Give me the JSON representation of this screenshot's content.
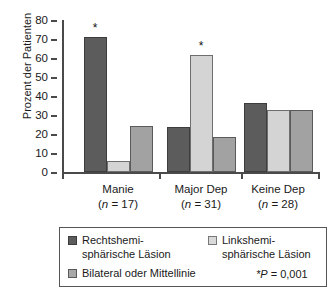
{
  "chart_data": {
    "type": "bar",
    "title": "",
    "xlabel": "",
    "ylabel": "Prozent der Patienten",
    "ylim": [
      0,
      80
    ],
    "yticks": [
      0,
      10,
      20,
      30,
      40,
      50,
      60,
      70,
      80
    ],
    "grid": false,
    "legend_position": "bottom",
    "categories": [
      "Manie",
      "Major Dep",
      "Keine Dep"
    ],
    "category_n": [
      "(n = 17)",
      "(n = 31)",
      "(n = 28)"
    ],
    "series": [
      {
        "name": "Rechtshemi-\nsphärische Läsion",
        "color": "#5c5c5c",
        "values": [
          71,
          23.5,
          36.5
        ]
      },
      {
        "name": "Linkshemi-\nsphärische Läsion",
        "color": "#d4d4d4",
        "values": [
          6,
          61.5,
          32.5
        ]
      },
      {
        "name": "Bilateral oder Mittellinie",
        "color": "#a2a2a2",
        "values": [
          24,
          18.5,
          32.5
        ]
      }
    ],
    "annotations": [
      {
        "label": "*",
        "category": "Manie",
        "series": "Rechtshemi-\nsphärische Läsion"
      },
      {
        "label": "*",
        "category": "Major Dep",
        "series": "Linkshemi-\nsphärische Läsion"
      }
    ],
    "significance_note": "*P = 0,001"
  },
  "legend": {
    "items": [
      {
        "label": "Rechtshemi-\nsphärische Läsion",
        "swatch": "dark"
      },
      {
        "label": "Linkshemi-\nsphärische Läsion",
        "swatch": "light"
      },
      {
        "label": "Bilateral oder Mittellinie",
        "swatch": "mid"
      }
    ],
    "p_value_prefix": "*P",
    "p_value_rest": " =  0,001"
  }
}
